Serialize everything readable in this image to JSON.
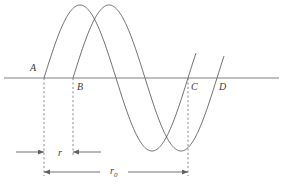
{
  "figure": {
    "type": "line-diagram",
    "background_color": "#ffffff",
    "curve_color": "#5a5a5a",
    "axis_color": "#808080",
    "dash_color": "#707070",
    "arrow_color": "#606060",
    "text_color": "#3a3a3a",
    "axis": {
      "name": "horizontal-axis",
      "y": 78,
      "x_start": 4,
      "x_end": 279
    },
    "point_labels": [
      {
        "id": "A",
        "text": "A",
        "x": 30,
        "y": 63,
        "crossing_x": 44
      },
      {
        "id": "B",
        "text": "B",
        "x": 77,
        "y": 82,
        "crossing_x": 73
      },
      {
        "id": "C",
        "text": "C",
        "x": 191,
        "y": 82,
        "crossing_x": 188
      },
      {
        "id": "D",
        "text": "D",
        "x": 219,
        "y": 82,
        "crossing_x": 216
      }
    ],
    "dashed_lines": [
      {
        "name": "dashed-line-A",
        "x": 44,
        "y_top": 78,
        "y_bottom": 176
      },
      {
        "name": "dashed-line-B",
        "x": 73,
        "y_top": 78,
        "y_bottom": 157
      },
      {
        "name": "dashed-line-C",
        "x": 188,
        "y_top": 78,
        "y_bottom": 176
      }
    ],
    "measures": [
      {
        "name": "measure-r",
        "label": "r",
        "label_sub": "",
        "label_x": 58,
        "label_y": 148,
        "y": 152,
        "from_x": 44,
        "to_x": 73,
        "left_tail_x": 16,
        "right_tail_x": 101,
        "style": "outward-tails-inward-arrows"
      },
      {
        "name": "measure-r0",
        "label": "r",
        "label_sub": "0",
        "label_x": 110,
        "label_y": 166,
        "y": 172,
        "from_x": 44,
        "to_x": 188,
        "style": "double-headed-with-label-gap",
        "gap_start_x": 100,
        "gap_end_x": 128
      }
    ],
    "waves": [
      {
        "name": "wave-front",
        "zero_crossings": [
          44,
          114,
          188
        ],
        "peak_x": 80,
        "peak_y": 5,
        "trough_x": 152,
        "trough_y": 148,
        "amplitude": 73,
        "period": 144,
        "phase_x": 44,
        "x_start": 44,
        "x_end": 196
      },
      {
        "name": "wave-back",
        "zero_crossings": [
          73,
          143,
          216
        ],
        "peak_x": 108,
        "peak_y": 5,
        "trough_x": 180,
        "trough_y": 148,
        "amplitude": 73,
        "period": 144,
        "phase_x": 73,
        "x_start": 73,
        "x_end": 224
      }
    ]
  }
}
